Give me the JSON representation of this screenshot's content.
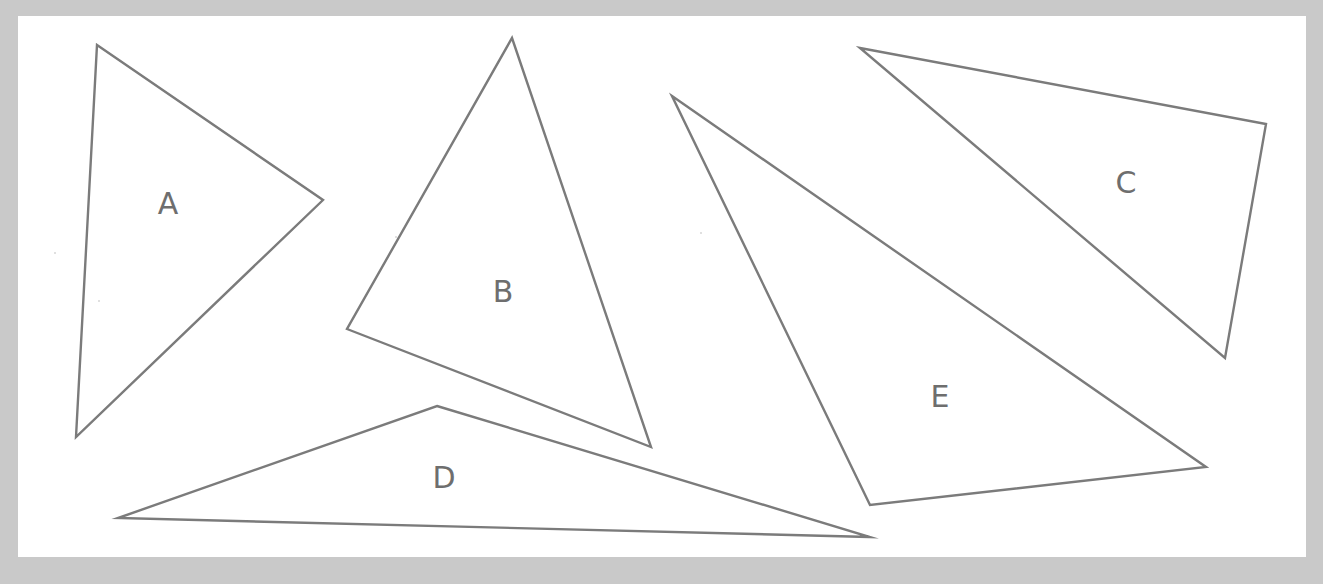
{
  "canvas": {
    "width": 1323,
    "height": 584,
    "background_color": "#c9c9c9",
    "paper_color": "#ffffff",
    "stroke_color": "#7b7b7b",
    "label_color": "#6e6e6e",
    "paper": {
      "x": 18,
      "y": 16,
      "width": 1288,
      "height": 541
    }
  },
  "diagram": {
    "type": "triangle-set",
    "shape_count": 5
  },
  "shapes": [
    {
      "id": "triangle-a",
      "label": "A",
      "label_position": {
        "x": 168,
        "y": 203
      },
      "points": "97,45 323,200 76,437",
      "vertices": [
        [
          97,
          45
        ],
        [
          323,
          200
        ],
        [
          76,
          437
        ]
      ]
    },
    {
      "id": "triangle-b",
      "label": "B",
      "label_position": {
        "x": 503,
        "y": 291
      },
      "points": "512,38 651,447 347,329",
      "vertices": [
        [
          512,
          38
        ],
        [
          651,
          447
        ],
        [
          347,
          329
        ]
      ]
    },
    {
      "id": "triangle-c",
      "label": "C",
      "label_position": {
        "x": 1126,
        "y": 182
      },
      "points": "860,48 1266,124 1225,358",
      "vertices": [
        [
          860,
          48
        ],
        [
          1266,
          124
        ],
        [
          1225,
          358
        ]
      ]
    },
    {
      "id": "triangle-d",
      "label": "D",
      "label_position": {
        "x": 444,
        "y": 477
      },
      "points": "437,406 870,537 118,518",
      "vertices": [
        [
          437,
          406
        ],
        [
          870,
          537
        ],
        [
          118,
          518
        ]
      ]
    },
    {
      "id": "triangle-e",
      "label": "E",
      "label_position": {
        "x": 940,
        "y": 396
      },
      "points": "672,96 1206,467 870,505",
      "vertices": [
        [
          672,
          96
        ],
        [
          1206,
          467
        ],
        [
          870,
          505
        ]
      ]
    }
  ]
}
